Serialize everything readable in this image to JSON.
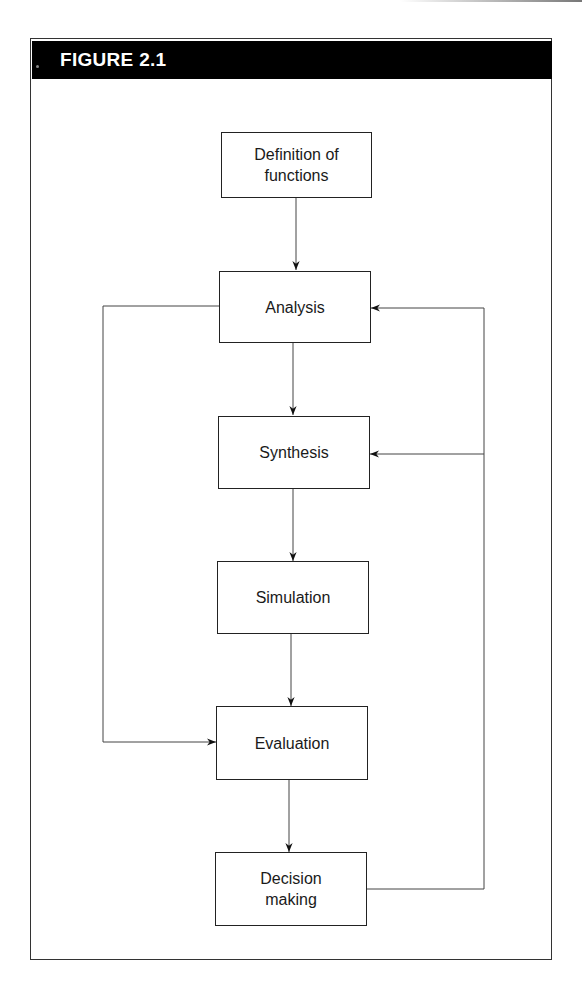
{
  "figure": {
    "title": "FIGURE 2.1",
    "header_color": "#000000",
    "line_color": "#555555",
    "nodes": [
      {
        "id": "definition",
        "label": "Definition of functions",
        "line1": "Definition of",
        "line2": "functions"
      },
      {
        "id": "analysis",
        "label": "Analysis"
      },
      {
        "id": "synthesis",
        "label": "Synthesis"
      },
      {
        "id": "simulation",
        "label": "Simulation"
      },
      {
        "id": "evaluation",
        "label": "Evaluation"
      },
      {
        "id": "decision",
        "label": "Decision making",
        "line1": "Decision",
        "line2": "making"
      }
    ],
    "edges": [
      {
        "from": "definition",
        "to": "analysis",
        "type": "forward"
      },
      {
        "from": "analysis",
        "to": "synthesis",
        "type": "forward"
      },
      {
        "from": "synthesis",
        "to": "simulation",
        "type": "forward"
      },
      {
        "from": "simulation",
        "to": "evaluation",
        "type": "forward"
      },
      {
        "from": "evaluation",
        "to": "decision",
        "type": "forward"
      },
      {
        "from": "analysis",
        "to": "evaluation",
        "type": "bypass-left"
      },
      {
        "from": "decision",
        "to": "analysis",
        "type": "feedback-right"
      },
      {
        "from": "decision",
        "to": "synthesis",
        "type": "feedback-right"
      }
    ]
  }
}
